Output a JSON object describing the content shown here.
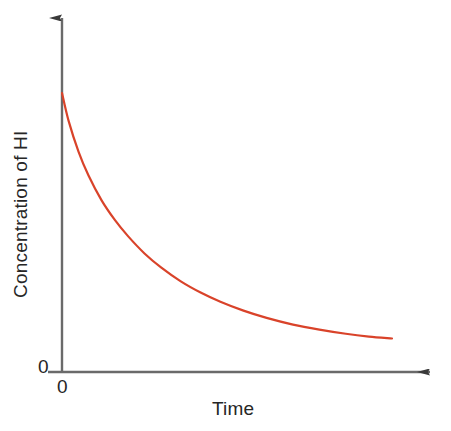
{
  "figure": {
    "width": 451,
    "height": 431,
    "background_color": "#ffffff"
  },
  "axes": {
    "color": "#6a6a6a",
    "x_axis": {
      "y": 372,
      "x_start": 48,
      "x_end": 443,
      "arrow": "right"
    },
    "y_axis": {
      "x": 62,
      "y_start": 372,
      "y_end": 6,
      "arrow": "up"
    }
  },
  "labels": {
    "ylabel": "Concentration of HI",
    "xlabel": "Time",
    "ytick_zero": "0",
    "xtick_zero": "0"
  },
  "chart_data": {
    "type": "line",
    "title": "",
    "xlabel": "Time",
    "ylabel": "Concentration of HI",
    "legend": [],
    "grid": false,
    "xlim": [
      0,
      1
    ],
    "ylim": [
      0,
      1
    ],
    "xticks": [
      "0"
    ],
    "yticks": [
      "0"
    ],
    "series": [
      {
        "name": "Concentration of HI",
        "color": "#d9432a",
        "line_width": 2.2,
        "description": "Exponential decay of HI concentration over time",
        "x": [
          0.0,
          0.02,
          0.05,
          0.08,
          0.12,
          0.16,
          0.2,
          0.25,
          0.3,
          0.36,
          0.42,
          0.48,
          0.55,
          0.62,
          0.7,
          0.78,
          0.86,
          0.93,
          1.0
        ],
        "y": [
          1.0,
          0.9,
          0.79,
          0.705,
          0.615,
          0.545,
          0.487,
          0.425,
          0.375,
          0.325,
          0.285,
          0.252,
          0.22,
          0.194,
          0.17,
          0.152,
          0.137,
          0.127,
          0.12
        ]
      }
    ],
    "pixel_path": {
      "start": [
        62,
        93
      ],
      "end": [
        392,
        336
      ],
      "note": "Curve drawn in figure pixel coordinates"
    }
  }
}
